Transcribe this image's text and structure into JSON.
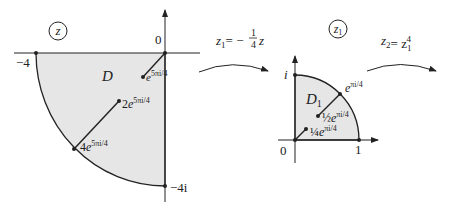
{
  "left_plane": {
    "plane_label": "z",
    "region_label": "D",
    "origin_label": "0",
    "neg_real_label": "−4",
    "neg_imag_label": "−4i",
    "points": [
      {
        "coef": "",
        "exp": "5πi/4"
      },
      {
        "coef": "2",
        "exp": "5πi/4"
      },
      {
        "coef": "4",
        "exp": "5πi/4"
      }
    ]
  },
  "map1": {
    "lhs": "z",
    "lhs_sub": "1",
    "rhs": "= −",
    "frac_num": "1",
    "frac_den": "4",
    "var": "z"
  },
  "right_plane": {
    "plane_label": "z",
    "plane_sub": "1",
    "region_label": "D",
    "region_sub": "1",
    "origin_label": "0",
    "imag_label": "i",
    "real_label": "1",
    "points": [
      {
        "coef": "",
        "exp": "πi/4"
      },
      {
        "coef": "½",
        "exp": "πi/4"
      },
      {
        "coef": "¼",
        "exp": "πi/4"
      }
    ]
  },
  "map2": {
    "lhs": "z",
    "lhs_sub": "2",
    "rhs": "= z",
    "rhs_sub": "1",
    "rhs_sup": "4"
  },
  "colors": {
    "region_fill": "#e6e6e6",
    "stroke": "#222222"
  }
}
